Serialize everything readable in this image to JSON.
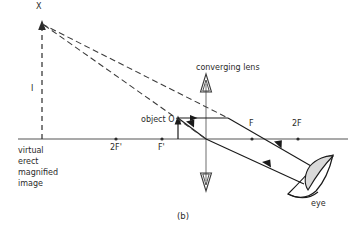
{
  "figure": {
    "caption": "(b)",
    "title_label": "converging lens"
  },
  "labels": {
    "image_point": "X",
    "image_height": "I",
    "object": "object O",
    "lens": "converging lens",
    "focus_left_near": "F'",
    "focus_left_far": "2F'",
    "focus_right_near": "F",
    "focus_right_far": "2F",
    "eye": "eye"
  },
  "image_description": {
    "line1": "virtual",
    "line2": "erect",
    "line3": "magnified",
    "line4": "image"
  },
  "colors": {
    "ink": "#2b2b2b",
    "axis": "#555555",
    "ray": "#1a1a1a",
    "dashed_ray": "#3a3a3a",
    "eye_lens_fill": "#d9d9d9",
    "background": "#ffffff"
  },
  "geometry": {
    "principal_axis_y": 139,
    "lens_x": 206,
    "object_x": 178,
    "object_top_y": 118,
    "image_x": 42,
    "image_top_y": 22,
    "focus_left_near_x": 162,
    "focus_left_far_x": 116,
    "focus_right_near_x": 252,
    "focus_right_far_x": 298
  }
}
